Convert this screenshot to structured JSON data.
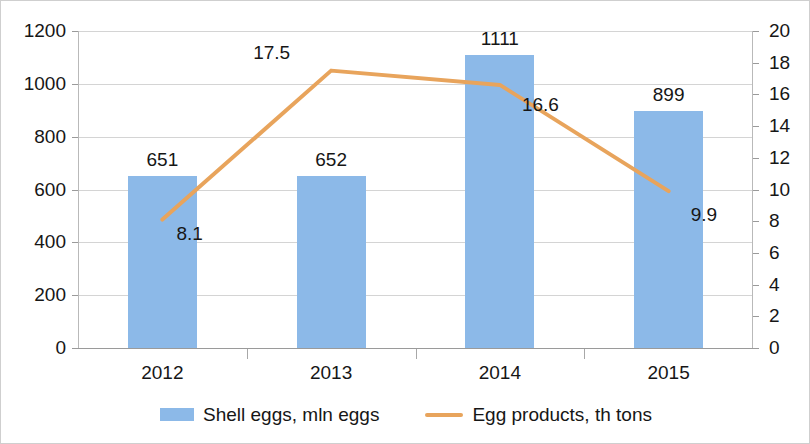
{
  "chart_data": {
    "type": "bar",
    "title": "",
    "subtitle": "",
    "xlabel": "",
    "ylabel": "",
    "grid": true,
    "legend_position": "bottom",
    "categories": [
      "2012",
      "2013",
      "2014",
      "2015"
    ],
    "axes": {
      "left": {
        "label": "",
        "min": 0,
        "max": 1200,
        "step": 200,
        "ticks": [
          "0",
          "200",
          "400",
          "600",
          "800",
          "1000",
          "1200"
        ]
      },
      "right": {
        "label": "",
        "min": 0,
        "max": 20,
        "step": 2,
        "ticks": [
          "0",
          "2",
          "4",
          "6",
          "8",
          "10",
          "12",
          "14",
          "16",
          "18",
          "20"
        ]
      }
    },
    "series": [
      {
        "name": "Shell eggs, mln eggs",
        "type": "bar",
        "axis": "left",
        "color": "#8CB9E8",
        "values": [
          651,
          652,
          1111,
          899
        ],
        "data_labels": [
          "651",
          "652",
          "1111",
          "899"
        ]
      },
      {
        "name": "Egg products, th tons",
        "type": "line",
        "axis": "right",
        "color": "#E8A45C",
        "values": [
          8.1,
          17.5,
          16.6,
          9.9
        ],
        "data_labels": [
          "8.1",
          "17.5",
          "16.6",
          "9.9"
        ]
      }
    ]
  },
  "legend": {
    "items": [
      {
        "label": "Shell eggs, mln eggs",
        "marker": "bar-swatch",
        "color": "#8CB9E8"
      },
      {
        "label": "Egg products, th tons",
        "marker": "line-swatch",
        "color": "#E8A45C"
      }
    ]
  }
}
